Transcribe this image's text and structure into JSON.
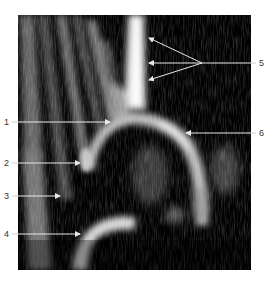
{
  "figure": {
    "type": "ultrasound-image",
    "frame": {
      "x": 18,
      "y": 15,
      "width": 233,
      "height": 255,
      "background": "#000000"
    },
    "annotation_color": "#e8e8e8",
    "labels": [
      {
        "id": "1",
        "text": "1",
        "label_x": 4,
        "label_y": 117,
        "line_y": 122,
        "line_x1": 18,
        "tip_x": 110,
        "tip_y": 122
      },
      {
        "id": "2",
        "text": "2",
        "label_x": 4,
        "label_y": 158,
        "line_y": 163,
        "line_x1": 18,
        "tip_x": 80,
        "tip_y": 163
      },
      {
        "id": "3",
        "text": "3",
        "label_x": 4,
        "label_y": 191,
        "line_y": 196,
        "line_x1": 18,
        "tip_x": 60,
        "tip_y": 196
      },
      {
        "id": "4",
        "text": "4",
        "label_x": 4,
        "label_y": 229,
        "line_y": 234,
        "line_x1": 18,
        "tip_x": 80,
        "tip_y": 234
      },
      {
        "id": "5",
        "text": "5",
        "label_x": 258,
        "label_y": 58,
        "line_y": 63,
        "fan_origin_x": 202,
        "fan_origin_y": 63,
        "tips": [
          {
            "x": 148,
            "y": 38
          },
          {
            "x": 148,
            "y": 63
          },
          {
            "x": 148,
            "y": 80
          }
        ]
      },
      {
        "id": "6",
        "text": "6",
        "label_x": 258,
        "label_y": 128,
        "line_y": 133,
        "tip_x": 186,
        "tip_y": 133
      }
    ]
  }
}
